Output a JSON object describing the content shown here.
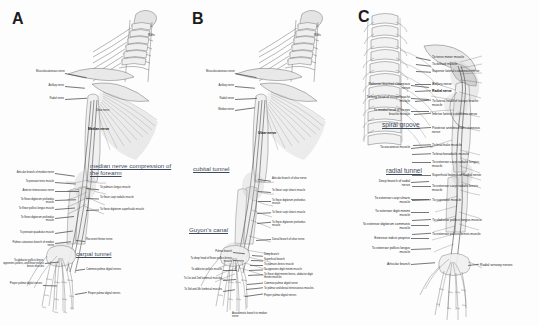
{
  "figure": {
    "background": "#fdfdfd",
    "ink": "#2a2a2a",
    "site_color": "#3e4a5c"
  },
  "panels": [
    {
      "id": "A",
      "letter": "A",
      "nerve": "Median nerve",
      "sites": [
        {
          "name": "median-nerve-compression-site",
          "text": "median nerve compression of the forearm"
        },
        {
          "name": "carpal-tunnel-site",
          "text": "carpal tunnel"
        }
      ],
      "bold_labels": [
        {
          "name": "median-nerve-label",
          "text": "Median nerve"
        }
      ],
      "labels_upper": [
        {
          "text": "Musculocutaneous nerve"
        },
        {
          "text": "Axillary nerve"
        },
        {
          "text": "Radial nerve"
        },
        {
          "text": "Ulnar nerve"
        },
        {
          "text": "Roots"
        }
      ],
      "labels_left": [
        {
          "text": "Articular branch of median nerve"
        },
        {
          "text": "To pronator teres muscle"
        },
        {
          "text": "Anterior interosseous nerve"
        },
        {
          "text": "To flexor digitorum profundus muscle"
        },
        {
          "text": "To flexor pollicis longus muscle"
        },
        {
          "text": "To flexor digitorum profundus muscle"
        },
        {
          "text": "To pronator quadratus muscle"
        },
        {
          "text": "Palmar cutaneous branch of median nerve"
        },
        {
          "text": "To abductor pollicis brevis, opponens pollicis, and flexor pollicis brevis muscles"
        },
        {
          "text": "Proper palmar digital nerves"
        }
      ],
      "labels_right": [
        {
          "text": "To palmaris longus muscle"
        },
        {
          "text": "To flexor carpi radialis muscle"
        },
        {
          "text": "To flexor digitorum superficialis muscle"
        },
        {
          "text": "Recurrent thenar nerve"
        },
        {
          "text": "Common palmar digital nerves"
        },
        {
          "text": "Proper palmar digital nerves"
        }
      ]
    },
    {
      "id": "B",
      "letter": "B",
      "nerve": "Ulnar nerve",
      "sites": [
        {
          "name": "cubital-tunnel-site",
          "text": "cubital tunnel"
        },
        {
          "name": "guyons-canal-site",
          "text": "Guyon's canal"
        }
      ],
      "bold_labels": [
        {
          "name": "ulnar-nerve-label",
          "text": "Ulnar nerve"
        }
      ],
      "labels_upper": [
        {
          "text": "Musculocutaneous nerve"
        },
        {
          "text": "Axillary nerve"
        },
        {
          "text": "Radial nerve"
        },
        {
          "text": "Median nerve"
        },
        {
          "text": "Roots"
        }
      ],
      "labels_right": [
        {
          "text": "Articular branch of ulnar nerve"
        },
        {
          "text": "To flexor carpi ulnaris muscle"
        },
        {
          "text": "To flexor digitorum profundus muscle"
        },
        {
          "text": "To flexor carpi ulnaris muscle"
        },
        {
          "text": "To flexor digitorum profundus muscle"
        },
        {
          "text": "Dorsal branch of ulnar nerve"
        },
        {
          "text": "Deep branch"
        },
        {
          "text": "Superficial branch"
        },
        {
          "text": "To palmaris brevis muscle"
        },
        {
          "text": "To opponens digiti minimi muscle"
        },
        {
          "text": "To flexor digiti minimi brevis, abductor digiti minimi muscles"
        },
        {
          "text": "Common palmar digital nerve"
        },
        {
          "text": "To palmar and dorsal interosseous muscles"
        },
        {
          "text": "Proper palmar digital nerves"
        }
      ],
      "labels_left": [
        {
          "text": "Palmar branch"
        },
        {
          "text": "To deep head of flexor pollicis brevis muscle"
        },
        {
          "text": "To adductor pollicis muscle"
        },
        {
          "text": "To 1st and 2nd lumbrical muscles"
        },
        {
          "text": "To 3rd and 4th lumbrical muscles"
        }
      ],
      "labels_bottom": [
        {
          "text": "Anastomotic branch to median nerve"
        }
      ]
    },
    {
      "id": "C",
      "letter": "C",
      "nerve": "Radial nerve",
      "sites": [
        {
          "name": "spiral-groove-site",
          "text": "spiral groove"
        },
        {
          "name": "radial-tunnel-site",
          "text": "radial tunnel"
        }
      ],
      "bold_labels": [
        {
          "name": "radial-nerve-label",
          "text": "Radial nerve"
        }
      ],
      "labels_right": [
        {
          "text": "To teres minor muscle"
        },
        {
          "text": "To deltoid muscle"
        },
        {
          "text": "Superior lateral cutaneous nerve"
        },
        {
          "text": "Axillary nerve"
        },
        {
          "text": "To lateral head of triceps brachii muscle"
        },
        {
          "text": "Inferior lateral cutaneous nerve"
        },
        {
          "text": "Posterior antebrachial cutaneous nerve"
        },
        {
          "text": "To brachialis muscle"
        },
        {
          "text": "To brachioradialis muscle"
        },
        {
          "text": "To extensor carpi radialis longus muscle"
        },
        {
          "text": "Superficial branch of Radial nerve"
        },
        {
          "text": "To extensor carpi radialis brevis muscle"
        },
        {
          "text": "To supinator muscle"
        },
        {
          "text": "To abductor pollicis longus muscle"
        },
        {
          "text": "To extensor pollicis brevis muscle"
        },
        {
          "text": "Radial sensory nerves"
        }
      ],
      "labels_left": [
        {
          "text": "Posterior brachial cutaneous nerve"
        },
        {
          "text": "To long head of triceps brachii muscle"
        },
        {
          "text": "To medial head of triceps brachii muscle"
        },
        {
          "text": "To anconeus muscle"
        },
        {
          "text": "Deep branch of radial nerve"
        },
        {
          "text": "To extensor carpi ulnaris muscle"
        },
        {
          "text": "To extensor digiti minimi muscle"
        },
        {
          "text": "To extensor digitorum communis muscle"
        },
        {
          "text": "Extensor indicis proprius"
        },
        {
          "text": "To extensor pollicis longus muscle"
        },
        {
          "text": "Articular branch"
        }
      ]
    }
  ]
}
